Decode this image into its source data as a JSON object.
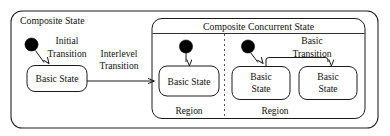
{
  "diagram": {
    "type": "uml-statechart",
    "title": "Composite State",
    "background_color": "#ffffff",
    "line_color": "#1a1a1a",
    "text_color": "#111111",
    "outer_state": {
      "name": "composite-state",
      "label": "Composite State"
    },
    "concurrent_state": {
      "name": "composite-concurrent-state",
      "label": "Composite Concurrent State"
    },
    "regions": [
      {
        "name": "region-left",
        "label": "Region"
      },
      {
        "name": "region-right",
        "label": "Region"
      }
    ],
    "states": [
      {
        "id": "outer-basic-state",
        "label": "Basic State",
        "lines": [
          "Basic State"
        ]
      },
      {
        "id": "region1-basic-state",
        "label": "Basic State",
        "lines": [
          "Basic State"
        ]
      },
      {
        "id": "region2-basic-state-a",
        "label": "Basic State",
        "lines": [
          "Basic",
          "State"
        ]
      },
      {
        "id": "region2-basic-state-b",
        "label": "Basic State",
        "lines": [
          "Basic",
          "State"
        ]
      }
    ],
    "initial_pseudostates": [
      {
        "id": "initial-outer",
        "label": "initial-state-dot"
      },
      {
        "id": "initial-region1",
        "label": "initial-state-dot"
      },
      {
        "id": "initial-region2",
        "label": "initial-state-dot"
      }
    ],
    "transitions": [
      {
        "id": "initial-transition",
        "label": "Initial Transition",
        "lines": [
          "Initial",
          "Transition"
        ],
        "from": "initial-outer",
        "to": "outer-basic-state"
      },
      {
        "id": "interlevel-transition",
        "label": "Interlevel Transition",
        "lines": [
          "Interlevel",
          "Transition"
        ],
        "from": "outer-basic-state",
        "to": "region1-basic-state"
      },
      {
        "id": "basic-transition",
        "label": "Basic Transition",
        "lines": [
          "Basic",
          "Transition"
        ],
        "from": "region2-basic-state-a",
        "to": "region2-basic-state-b"
      },
      {
        "id": "initial-transition-region1",
        "label": "",
        "lines": [],
        "from": "initial-region1",
        "to": "region1-basic-state"
      },
      {
        "id": "initial-transition-region2",
        "label": "",
        "lines": [],
        "from": "initial-region2",
        "to": "region2-basic-state-a"
      }
    ]
  }
}
